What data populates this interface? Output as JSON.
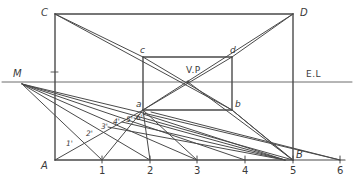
{
  "figure": {
    "type": "perspective-construction-diagram",
    "stroke_color": "#4a4a4a",
    "label_color": "#3a3a3a",
    "background_color": "#ffffff",
    "width": 360,
    "height": 185
  },
  "labels": {
    "outer_top_left": "C",
    "outer_top_right": "D",
    "outer_bottom_left": "A",
    "outer_bottom_right": "B",
    "inner_top_left": "c",
    "inner_top_right": "d",
    "inner_bottom_left": "a",
    "inner_bottom_right": "b",
    "measuring_point": "M",
    "vanishing_point": "V.P",
    "eye_level": "E.L"
  },
  "baseline_ticks": [
    {
      "label": "1",
      "x": 102
    },
    {
      "label": "2",
      "x": 150
    },
    {
      "label": "3",
      "x": 197
    },
    {
      "label": "4",
      "x": 245
    },
    {
      "label": "5",
      "x": 293
    },
    {
      "label": "6",
      "x": 340
    }
  ],
  "depth_marks": [
    {
      "label": "1'",
      "x": 71,
      "y": 146
    },
    {
      "label": "2'",
      "x": 91,
      "y": 136
    },
    {
      "label": "3'",
      "x": 105,
      "y": 128
    },
    {
      "label": "4'",
      "x": 117,
      "y": 122
    },
    {
      "label": "5'",
      "x": 130,
      "y": 119
    },
    {
      "label": "6'",
      "x": 141,
      "y": 117
    }
  ],
  "geometry": {
    "outer_rect": {
      "left": 55,
      "top": 14,
      "right": 293,
      "bottom": 160
    },
    "inner_rect": {
      "left": 143,
      "top": 57,
      "right": 232,
      "bottom": 110
    },
    "eye_level_y": 82,
    "eye_level_x1": 2,
    "eye_level_x2": 352,
    "measuring_point": {
      "x": 22,
      "y": 84
    },
    "vanishing_point": {
      "x": 188,
      "y": 82
    },
    "baseline_y": 160,
    "baseline_x1": 55,
    "baseline_x2": 345
  }
}
